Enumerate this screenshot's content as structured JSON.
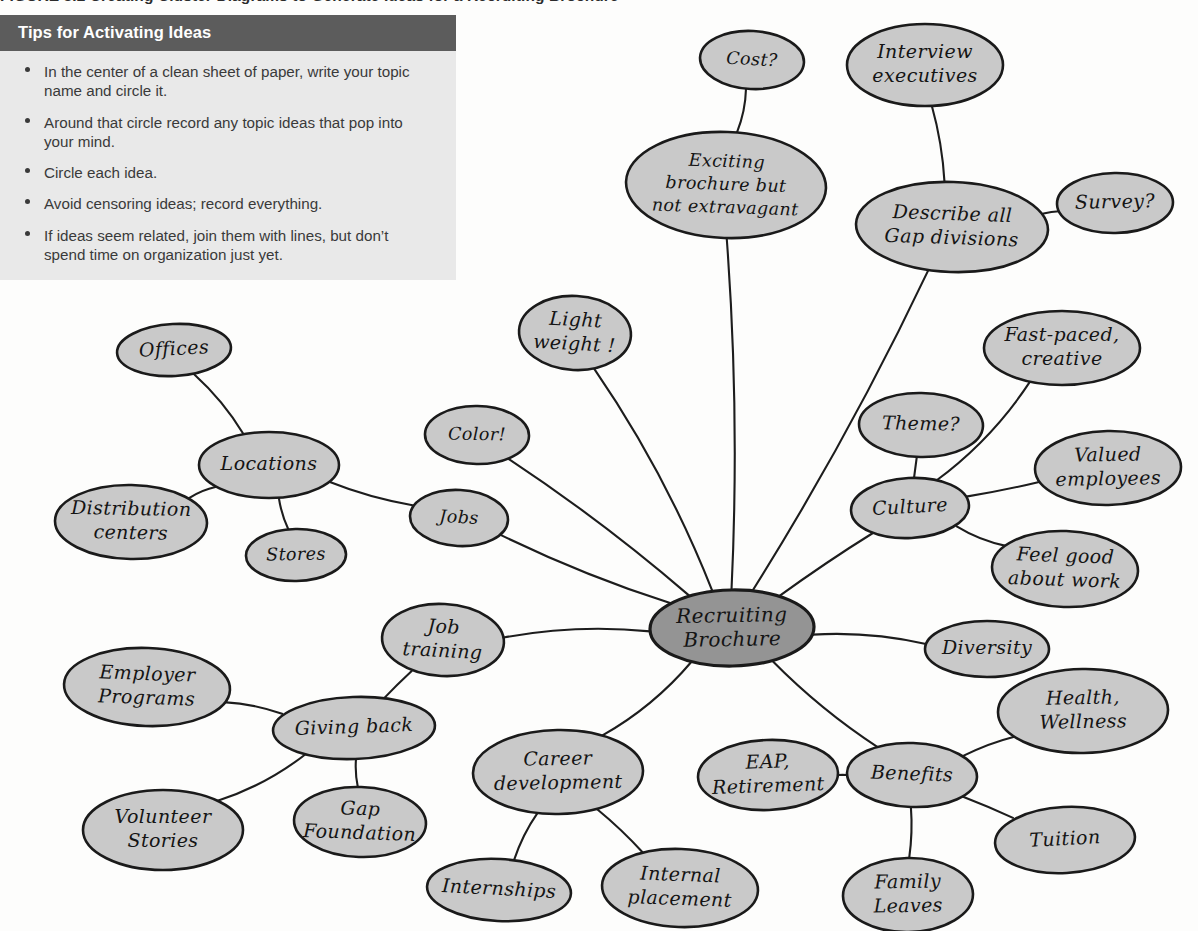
{
  "figure": {
    "caption": "FIGURE 3.2   Creating Cluster Diagrams to Generate Ideas for a Recruiting Brochure"
  },
  "tips": {
    "title": "Tips for Activating Ideas",
    "items": [
      "In the center of a clean sheet of paper, write your topic name and circle it.",
      "Around that circle record any topic ideas that pop into your mind.",
      "Circle each idea.",
      "Avoid censoring ideas; record everything.",
      "If ideas seem related, join them with lines, but don’t spend time on organization just yet."
    ]
  },
  "colors": {
    "header_bar": "#5c5c5c",
    "tips_body": "#e9e9e9",
    "bubble_fill": "#c9c9c9",
    "center_bubble_fill": "#949494",
    "stroke": "#1a1a1a",
    "page_background": "#fdfdfc"
  },
  "chart_data": {
    "type": "diagram",
    "center": "Recruiting Brochure",
    "nodes": [
      {
        "id": "center",
        "label": "Recruiting Brochure",
        "lines": [
          "Recruiting",
          "Brochure"
        ],
        "x": 732,
        "y": 628,
        "rx": 82,
        "ry": 38,
        "role": "center"
      },
      {
        "id": "cost",
        "label": "Cost?",
        "lines": [
          "Cost?"
        ],
        "x": 752,
        "y": 60,
        "rx": 52,
        "ry": 29,
        "role": "leaf"
      },
      {
        "id": "exciting",
        "label": "Exciting brochure but not extravagant",
        "lines": [
          "Exciting",
          "brochure but",
          "not extravagant"
        ],
        "x": 726,
        "y": 185,
        "rx": 100,
        "ry": 53,
        "role": "branch"
      },
      {
        "id": "interview",
        "label": "Interview executives",
        "lines": [
          "Interview",
          "executives"
        ],
        "x": 925,
        "y": 65,
        "rx": 78,
        "ry": 41,
        "role": "leaf"
      },
      {
        "id": "describe",
        "label": "Describe all Gap divisions",
        "lines": [
          "Describe all",
          "Gap divisions"
        ],
        "x": 952,
        "y": 227,
        "rx": 96,
        "ry": 45,
        "role": "branch"
      },
      {
        "id": "survey",
        "label": "Survey?",
        "lines": [
          "Survey?"
        ],
        "x": 1115,
        "y": 203,
        "rx": 58,
        "ry": 30,
        "role": "leaf"
      },
      {
        "id": "lightweight",
        "label": "Light weight !",
        "lines": [
          "Light",
          "weight !"
        ],
        "x": 575,
        "y": 333,
        "rx": 56,
        "ry": 37,
        "role": "leaf"
      },
      {
        "id": "color",
        "label": "Color!",
        "lines": [
          "Color!"
        ],
        "x": 477,
        "y": 435,
        "rx": 52,
        "ry": 29,
        "role": "leaf"
      },
      {
        "id": "jobs",
        "label": "Jobs",
        "lines": [
          "Jobs"
        ],
        "x": 459,
        "y": 518,
        "rx": 49,
        "ry": 28,
        "role": "branch"
      },
      {
        "id": "offices",
        "label": "Offices",
        "lines": [
          "Offices"
        ],
        "x": 174,
        "y": 350,
        "rx": 57,
        "ry": 26,
        "role": "leaf"
      },
      {
        "id": "locations",
        "label": "Locations",
        "lines": [
          "Locations"
        ],
        "x": 269,
        "y": 465,
        "rx": 70,
        "ry": 33,
        "role": "branch"
      },
      {
        "id": "distribution",
        "label": "Distribution centers",
        "lines": [
          "Distribution",
          "centers"
        ],
        "x": 131,
        "y": 522,
        "rx": 76,
        "ry": 37,
        "role": "leaf"
      },
      {
        "id": "stores",
        "label": "Stores",
        "lines": [
          "Stores"
        ],
        "x": 296,
        "y": 555,
        "rx": 50,
        "ry": 26,
        "role": "leaf"
      },
      {
        "id": "theme",
        "label": "Theme?",
        "lines": [
          "Theme?"
        ],
        "x": 921,
        "y": 425,
        "rx": 62,
        "ry": 32,
        "role": "leaf"
      },
      {
        "id": "fastpaced",
        "label": "Fast-paced, creative",
        "lines": [
          "Fast-paced,",
          "creative"
        ],
        "x": 1062,
        "y": 348,
        "rx": 78,
        "ry": 37,
        "role": "leaf"
      },
      {
        "id": "culture",
        "label": "Culture",
        "lines": [
          "Culture"
        ],
        "x": 910,
        "y": 508,
        "rx": 59,
        "ry": 30,
        "role": "branch"
      },
      {
        "id": "valued",
        "label": "Valued employees",
        "lines": [
          "Valued",
          "employees"
        ],
        "x": 1108,
        "y": 468,
        "rx": 73,
        "ry": 37,
        "role": "leaf"
      },
      {
        "id": "feelgood",
        "label": "Feel good about work",
        "lines": [
          "Feel good",
          "about work"
        ],
        "x": 1065,
        "y": 569,
        "rx": 73,
        "ry": 38,
        "role": "leaf"
      },
      {
        "id": "diversity",
        "label": "Diversity",
        "lines": [
          "Diversity"
        ],
        "x": 987,
        "y": 649,
        "rx": 62,
        "ry": 28,
        "role": "leaf"
      },
      {
        "id": "jobtraining",
        "label": "Job training",
        "lines": [
          "Job",
          "training"
        ],
        "x": 443,
        "y": 640,
        "rx": 61,
        "ry": 36,
        "role": "leaf"
      },
      {
        "id": "givingback",
        "label": "Giving back",
        "lines": [
          "Giving back"
        ],
        "x": 354,
        "y": 728,
        "rx": 81,
        "ry": 31,
        "role": "branch"
      },
      {
        "id": "employer",
        "label": "Employer Programs",
        "lines": [
          "Employer",
          "Programs"
        ],
        "x": 147,
        "y": 687,
        "rx": 83,
        "ry": 39,
        "role": "leaf"
      },
      {
        "id": "volunteer",
        "label": "Volunteer Stories",
        "lines": [
          "Volunteer",
          "Stories"
        ],
        "x": 163,
        "y": 830,
        "rx": 80,
        "ry": 40,
        "role": "leaf"
      },
      {
        "id": "gapfound",
        "label": "Gap Foundation",
        "lines": [
          "Gap",
          "Foundation"
        ],
        "x": 360,
        "y": 822,
        "rx": 66,
        "ry": 35,
        "role": "leaf"
      },
      {
        "id": "career",
        "label": "Career development",
        "lines": [
          "Career",
          "development"
        ],
        "x": 558,
        "y": 772,
        "rx": 85,
        "ry": 42,
        "role": "branch"
      },
      {
        "id": "internships",
        "label": "Internships",
        "lines": [
          "Internships"
        ],
        "x": 499,
        "y": 890,
        "rx": 72,
        "ry": 31,
        "role": "leaf"
      },
      {
        "id": "internal",
        "label": "Internal placement",
        "lines": [
          "Internal",
          "placement"
        ],
        "x": 680,
        "y": 888,
        "rx": 78,
        "ry": 39,
        "role": "leaf"
      },
      {
        "id": "eap",
        "label": "EAP, Retirement",
        "lines": [
          "EAP,",
          "Retirement"
        ],
        "x": 768,
        "y": 775,
        "rx": 70,
        "ry": 35,
        "role": "leaf"
      },
      {
        "id": "benefits",
        "label": "Benefits",
        "lines": [
          "Benefits"
        ],
        "x": 912,
        "y": 775,
        "rx": 65,
        "ry": 32,
        "role": "branch"
      },
      {
        "id": "health",
        "label": "Health, Wellness",
        "lines": [
          "Health,",
          "Wellness"
        ],
        "x": 1083,
        "y": 711,
        "rx": 85,
        "ry": 42,
        "role": "leaf"
      },
      {
        "id": "tuition",
        "label": "Tuition",
        "lines": [
          "Tuition"
        ],
        "x": 1065,
        "y": 840,
        "rx": 70,
        "ry": 33,
        "role": "leaf"
      },
      {
        "id": "family",
        "label": "Family Leaves",
        "lines": [
          "Family",
          "Leaves"
        ],
        "x": 908,
        "y": 895,
        "rx": 65,
        "ry": 37,
        "role": "leaf"
      }
    ],
    "edges": [
      {
        "from": "cost",
        "to": "exciting"
      },
      {
        "from": "exciting",
        "to": "center"
      },
      {
        "from": "interview",
        "to": "describe"
      },
      {
        "from": "describe",
        "to": "survey"
      },
      {
        "from": "describe",
        "to": "center"
      },
      {
        "from": "lightweight",
        "to": "center"
      },
      {
        "from": "color",
        "to": "center"
      },
      {
        "from": "jobs",
        "to": "center"
      },
      {
        "from": "jobs",
        "to": "locations"
      },
      {
        "from": "offices",
        "to": "locations"
      },
      {
        "from": "locations",
        "to": "distribution"
      },
      {
        "from": "locations",
        "to": "stores"
      },
      {
        "from": "theme",
        "to": "culture"
      },
      {
        "from": "fastpaced",
        "to": "culture"
      },
      {
        "from": "culture",
        "to": "valued"
      },
      {
        "from": "culture",
        "to": "feelgood"
      },
      {
        "from": "culture",
        "to": "center"
      },
      {
        "from": "diversity",
        "to": "center"
      },
      {
        "from": "jobtraining",
        "to": "center"
      },
      {
        "from": "givingback",
        "to": "jobtraining"
      },
      {
        "from": "givingback",
        "to": "employer"
      },
      {
        "from": "givingback",
        "to": "volunteer"
      },
      {
        "from": "givingback",
        "to": "gapfound"
      },
      {
        "from": "career",
        "to": "center"
      },
      {
        "from": "career",
        "to": "internships"
      },
      {
        "from": "career",
        "to": "internal"
      },
      {
        "from": "eap",
        "to": "benefits"
      },
      {
        "from": "benefits",
        "to": "center"
      },
      {
        "from": "benefits",
        "to": "health"
      },
      {
        "from": "benefits",
        "to": "tuition"
      },
      {
        "from": "benefits",
        "to": "family"
      }
    ]
  }
}
